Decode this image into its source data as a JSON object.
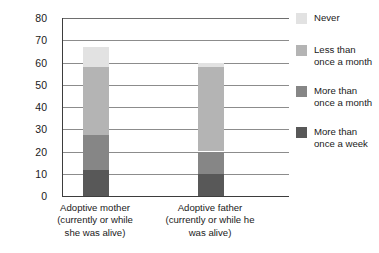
{
  "chart_data": {
    "type": "bar",
    "subtype": "stacked-bar",
    "title": "",
    "xlabel": "",
    "ylabel": "",
    "ylim": [
      0,
      80
    ],
    "ytick_step": 10,
    "yticks": [
      80,
      70,
      60,
      50,
      40,
      30,
      20,
      10,
      0
    ],
    "grid": true,
    "legend_position": "right",
    "categories": [
      "Adoptive mother\n(currently or while\nshe was alive)",
      "Adoptive father\n(currently or while he\nwas alive)"
    ],
    "category_lines": [
      [
        "Adoptive mother",
        "(currently or while",
        "she was alive)"
      ],
      [
        "Adoptive father",
        "(currently or while he",
        "was alive)"
      ]
    ],
    "series": [
      {
        "name": "More than once a week",
        "legend_lines": [
          "More than",
          "once a week"
        ],
        "color": "#585858",
        "values": [
          11.5,
          10
        ]
      },
      {
        "name": "More than once a month",
        "legend_lines": [
          "More than",
          "once a month"
        ],
        "color": "#868686",
        "values": [
          16,
          10
        ]
      },
      {
        "name": "Less than once a month",
        "legend_lines": [
          "Less than",
          "once a month"
        ],
        "color": "#b4b4b4",
        "values": [
          30.5,
          38
        ]
      },
      {
        "name": "Never",
        "legend_lines": [
          "Never"
        ],
        "color": "#e2e2e2",
        "values": [
          9,
          2
        ]
      }
    ],
    "totals": [
      67,
      60
    ]
  },
  "axis": {
    "tick_labels": [
      "80",
      "70",
      "60",
      "50",
      "40",
      "30",
      "20",
      "10",
      "0"
    ]
  },
  "legend": {
    "entries": [
      {
        "label": "Never",
        "color": "#e2e2e2"
      },
      {
        "label": "Less than\nonce a month",
        "color": "#b4b4b4"
      },
      {
        "label": "More than\nonce a month",
        "color": "#868686"
      },
      {
        "label": "More than\nonce a week",
        "color": "#585858"
      }
    ]
  },
  "colors": {
    "axis": "#3d3d3d",
    "gridline": "#8c8c8c",
    "text": "#1a1a1a",
    "background": "#ffffff"
  }
}
